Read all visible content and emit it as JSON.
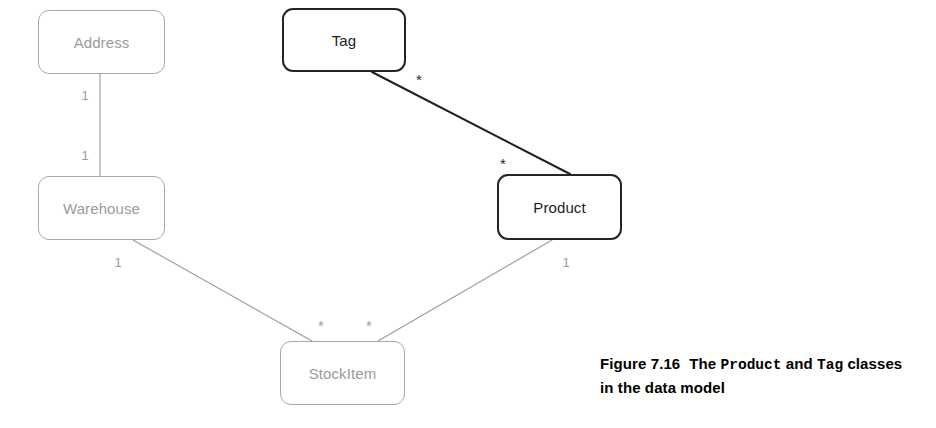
{
  "diagram": {
    "type": "uml-class-diagram",
    "background_color": "#ffffff",
    "classes": [
      {
        "id": "address",
        "name": "Address",
        "x": 38,
        "y": 10,
        "width": 127,
        "height": 64,
        "emphasis": "light",
        "border_color": "#a9a9ab",
        "text_color": "#9a9a9d"
      },
      {
        "id": "tag",
        "name": "Tag",
        "x": 282,
        "y": 8,
        "width": 124,
        "height": 64,
        "emphasis": "dark",
        "border_color": "#24242a",
        "text_color": "#1c1c22"
      },
      {
        "id": "warehouse",
        "name": "Warehouse",
        "x": 38,
        "y": 176,
        "width": 127,
        "height": 64,
        "emphasis": "light",
        "border_color": "#a9a9ab",
        "text_color": "#9a9a9d"
      },
      {
        "id": "product",
        "name": "Product",
        "x": 497,
        "y": 174,
        "width": 125,
        "height": 66,
        "emphasis": "dark",
        "border_color": "#24242a",
        "text_color": "#1c1c22"
      },
      {
        "id": "stockitem",
        "name": "StockItem",
        "x": 280,
        "y": 341,
        "width": 125,
        "height": 64,
        "emphasis": "light",
        "border_color": "#a9a9ab",
        "text_color": "#9a9a9d"
      }
    ],
    "associations": [
      {
        "id": "address-warehouse",
        "from": "address",
        "to": "warehouse",
        "x1": 100,
        "y1": 74,
        "x2": 100,
        "y2": 176,
        "emphasis": "light",
        "color": "#9a9a9d",
        "stroke_width": 1.1,
        "from_multiplicity": "1",
        "to_multiplicity": "1",
        "from_label_x": 85,
        "from_label_y": 95,
        "to_label_x": 85,
        "to_label_y": 155
      },
      {
        "id": "tag-product",
        "from": "tag",
        "to": "product",
        "x1": 372,
        "y1": 72,
        "x2": 570,
        "y2": 174,
        "emphasis": "dark",
        "color": "#1f1f25",
        "stroke_width": 2.0,
        "from_multiplicity": "*",
        "to_multiplicity": "*",
        "from_label_x": 419,
        "from_label_y": 79,
        "to_label_x": 503,
        "to_label_y": 163
      },
      {
        "id": "warehouse-stockitem",
        "from": "warehouse",
        "to": "stockitem",
        "x1": 133,
        "y1": 240,
        "x2": 312,
        "y2": 341,
        "emphasis": "light",
        "color": "#9a9a9d",
        "stroke_width": 1.1,
        "from_multiplicity": "1",
        "to_multiplicity": "*",
        "from_label_x": 118,
        "from_label_y": 262,
        "to_label_x": 321,
        "to_label_y": 325
      },
      {
        "id": "product-stockitem",
        "from": "product",
        "to": "stockitem",
        "x1": 552,
        "y1": 240,
        "x2": 378,
        "y2": 341,
        "emphasis": "light",
        "color": "#9a9a9d",
        "stroke_width": 1.1,
        "from_multiplicity": "1",
        "to_multiplicity": "*",
        "from_label_x": 566,
        "from_label_y": 262,
        "to_label_x": 369,
        "to_label_y": 325
      }
    ]
  },
  "caption": {
    "figure_number": "Figure 7.16",
    "text_part1": "The",
    "class_name_1": "Product",
    "text_part2": "and",
    "class_name_2": "Tag",
    "text_part3": "classes in the data model"
  }
}
